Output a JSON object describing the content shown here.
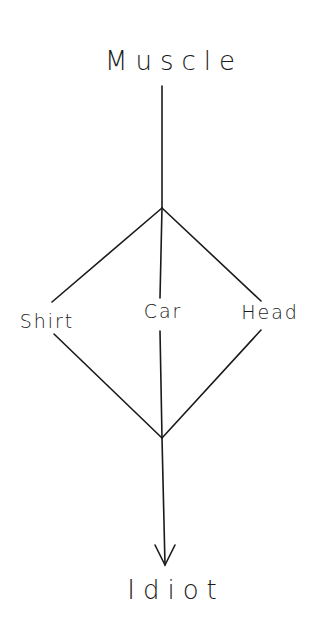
{
  "diagram": {
    "top": {
      "label": "Muscle"
    },
    "middle": [
      {
        "label": "Shirt"
      },
      {
        "label": "Car"
      },
      {
        "label": "Head"
      }
    ],
    "bottom": {
      "label": "Idiot"
    },
    "colors": {
      "line": "#1a1a1a",
      "background": "#ffffff"
    }
  }
}
